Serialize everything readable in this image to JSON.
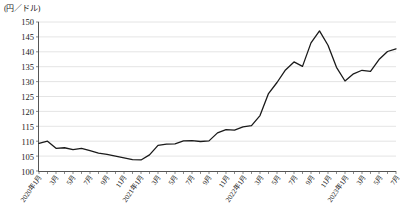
{
  "chart_data": {
    "type": "line",
    "title": "",
    "subtitle": "",
    "unit_label": "(円／ドル)",
    "ylabel": "",
    "xlabel": "",
    "ylim": [
      100,
      150
    ],
    "ytick_step": 5,
    "yticks": [
      100,
      105,
      110,
      115,
      120,
      125,
      130,
      135,
      140,
      145,
      150
    ],
    "grid": true,
    "grid_axis": "y",
    "legend": false,
    "legend_position": "none",
    "line_color": "#1a1a1a",
    "grid_color": "#d8d8d8",
    "axis_color": "#555555",
    "x_tick_interval_months": 1,
    "x_label_interval_months": 2,
    "categories": [
      "2020年1月",
      "2020年2月",
      "2020年3月",
      "2020年4月",
      "2020年5月",
      "2020年6月",
      "2020年7月",
      "2020年8月",
      "2020年9月",
      "2020年10月",
      "2020年11月",
      "2020年12月",
      "2021年1月",
      "2021年2月",
      "2021年3月",
      "2021年4月",
      "2021年5月",
      "2021年6月",
      "2021年7月",
      "2021年8月",
      "2021年9月",
      "2021年10月",
      "2021年11月",
      "2021年12月",
      "2022年1月",
      "2022年2月",
      "2022年3月",
      "2022年4月",
      "2022年5月",
      "2022年6月",
      "2022年7月",
      "2022年8月",
      "2022年9月",
      "2022年10月",
      "2022年11月",
      "2022年12月",
      "2023年1月",
      "2023年2月",
      "2023年3月",
      "2023年4月",
      "2023年5月",
      "2023年6月",
      "2023年7月"
    ],
    "x_tick_labels": [
      "2020年1月",
      "3月",
      "5月",
      "7月",
      "9月",
      "11月",
      "2021年1月",
      "3月",
      "5月",
      "7月",
      "9月",
      "11月",
      "2022年1月",
      "3月",
      "5月",
      "7月",
      "9月",
      "11月",
      "2023年1月",
      "3月",
      "5月",
      "7月"
    ],
    "series": [
      {
        "name": "円／ドル為替レート",
        "values": [
          109.3,
          110.0,
          107.6,
          107.8,
          107.2,
          107.6,
          106.8,
          106.0,
          105.6,
          105.0,
          104.4,
          103.8,
          103.7,
          105.4,
          108.6,
          109.0,
          109.1,
          110.1,
          110.2,
          109.9,
          110.1,
          112.8,
          113.9,
          113.7,
          114.8,
          115.2,
          118.6,
          126.0,
          129.7,
          133.9,
          136.6,
          135.1,
          143.0,
          147.0,
          142.2,
          134.8,
          130.2,
          132.6,
          133.8,
          133.4,
          137.4,
          140.1,
          141.0
        ]
      }
    ]
  }
}
